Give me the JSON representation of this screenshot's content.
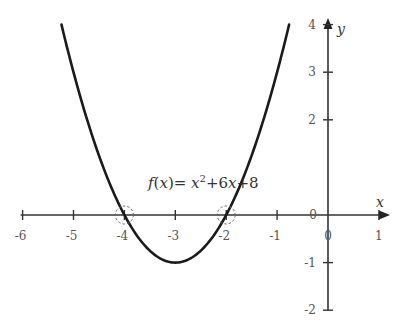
{
  "chart_data": {
    "type": "line",
    "title": "",
    "function": "f(x) = x^2 + 6x + 8",
    "annotation": {
      "prefix_f": "f",
      "open": "(",
      "var": "x",
      "close": ")",
      "eq": "= ",
      "x1": "x",
      "sup": "2",
      "plus6": "+6",
      "x2": "x",
      "plus8": "+8"
    },
    "xlabel": "x",
    "ylabel": "y",
    "xlim": [
      -6,
      1
    ],
    "ylim": [
      -2,
      4
    ],
    "x_ticks": [
      -6,
      -5,
      -4,
      -3,
      -2,
      -1,
      0,
      1
    ],
    "y_ticks": [
      4,
      3,
      2,
      0,
      -1,
      -2
    ],
    "x_tick_labels": [
      "-6",
      "-5",
      "-4",
      "-3",
      "-2",
      "-1",
      "0",
      "1"
    ],
    "y_tick_labels": [
      "4",
      "3",
      "2",
      "0",
      "-1",
      "-2"
    ],
    "origin_label": "0",
    "grid": false,
    "series": [
      {
        "name": "f(x)",
        "x": [
          -5.236,
          -5,
          -4.5,
          -4,
          -3.5,
          -3,
          -2.5,
          -2,
          -1.5,
          -1,
          -0.764
        ],
        "y": [
          4,
          3,
          1.25,
          0,
          -0.75,
          -1,
          -0.75,
          0,
          1.25,
          3,
          4
        ]
      }
    ],
    "highlighted_points": [
      {
        "x": -4,
        "y": 0,
        "style": "dashed-circle"
      },
      {
        "x": -2,
        "y": 0,
        "style": "dashed-circle"
      }
    ],
    "vertex": {
      "x": -3,
      "y": -1
    }
  }
}
